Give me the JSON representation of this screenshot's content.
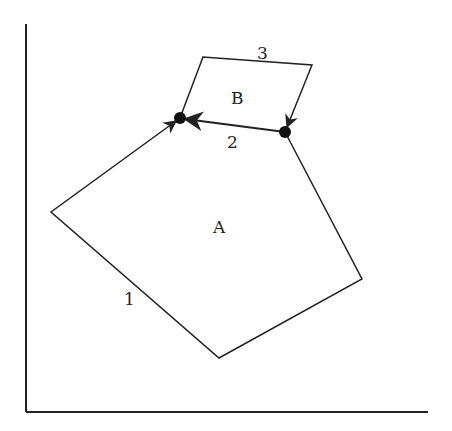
{
  "diagram": {
    "axes": {
      "origin": [
        26,
        412
      ],
      "y_top": [
        26,
        24
      ],
      "x_end": [
        428,
        412
      ]
    },
    "regions": [
      {
        "label": "A",
        "position": [
          221,
          232
        ]
      },
      {
        "label": "B",
        "position": [
          238,
          103
        ]
      }
    ],
    "paths": [
      {
        "label": "1",
        "position": [
          130,
          305
        ],
        "points": [
          [
            285,
            132
          ],
          [
            362,
            279
          ],
          [
            219,
            358
          ],
          [
            51,
            212
          ],
          [
            180,
            118
          ]
        ]
      },
      {
        "label": "2",
        "position": [
          233,
          146
        ],
        "points": [
          [
            285,
            132
          ],
          [
            180,
            118
          ]
        ]
      },
      {
        "label": "3",
        "position": [
          263,
          58
        ],
        "points": [
          [
            180,
            118
          ],
          [
            203,
            57
          ],
          [
            312,
            65
          ],
          [
            285,
            132
          ]
        ]
      }
    ],
    "points": [
      {
        "name": "left-junction",
        "position": [
          180,
          118
        ]
      },
      {
        "name": "right-junction",
        "position": [
          285,
          132
        ]
      }
    ],
    "colors": {
      "stroke": "#222222",
      "background": "#ffffff"
    }
  }
}
